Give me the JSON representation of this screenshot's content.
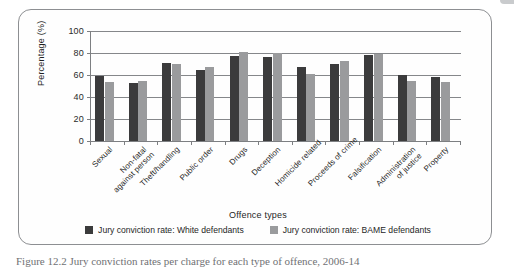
{
  "figure": {
    "caption": "Figure 12.2  Jury conviction rates per charge for each type of offence, 2006-14",
    "y_axis_title": "Percentage (%)",
    "x_axis_title": "Offence types"
  },
  "legend": {
    "items": [
      {
        "label": "Jury conviction rate: White defendants",
        "color": "#3b3b3c",
        "swatch": "legend-swatch-white-defendants"
      },
      {
        "label": "Jury conviction rate: BAME defendants",
        "color": "#9a9b9d",
        "swatch": "legend-swatch-bame-defendants"
      }
    ]
  },
  "chart_data": {
    "type": "bar",
    "title": "",
    "xlabel": "Offence types",
    "ylabel": "Percentage (%)",
    "ylim": [
      0,
      100
    ],
    "yticks": [
      0,
      20,
      40,
      60,
      80,
      100
    ],
    "grid": true,
    "legend_position": "bottom",
    "categories": [
      "Sexual",
      "Non-fatal\nagainst person",
      "Theft/handling",
      "Public order",
      "Drugs",
      "Deception",
      "Homicide related",
      "Proceeds of crime",
      "Falsification",
      "Administration\nof justice",
      "Property"
    ],
    "series": [
      {
        "name": "Jury conviction rate: White defendants",
        "color": "#3b3b3c",
        "values": [
          59,
          53,
          71,
          65,
          77,
          76,
          67,
          70,
          78,
          60,
          58
        ]
      },
      {
        "name": "Jury conviction rate: BAME defendants",
        "color": "#9a9b9d",
        "values": [
          54,
          55,
          70,
          67,
          81,
          80,
          61,
          73,
          79,
          55,
          54
        ]
      }
    ]
  }
}
